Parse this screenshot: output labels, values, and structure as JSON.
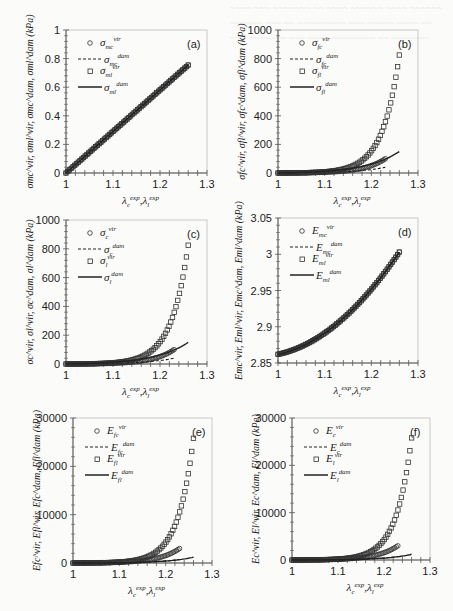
{
  "figure": {
    "background_bleed": "show-through text from reverse page (illegible)",
    "x_tick_labels": [
      "1",
      "1.1",
      "1.2",
      "1.3"
    ]
  },
  "chart_data": [
    {
      "id": "a",
      "panel_label": "(a)",
      "type": "line",
      "box": {
        "x0": 66,
        "x1": 207,
        "y0": 30,
        "y1": 173
      },
      "xlim": [
        1,
        1.3
      ],
      "ylim": [
        0,
        1
      ],
      "yticks": [
        0,
        0.2,
        0.4,
        0.6,
        0.8,
        1
      ],
      "ytick_labels": [
        "0",
        "0.2",
        "0.4",
        "0.6",
        "0.8",
        "1"
      ],
      "xlabel": "λc^exp, λl^exp",
      "ylabel": "σmc^vir, σml^vir, σmc^dam, σml^dam (kPa)",
      "legend": [
        {
          "marker": "circle",
          "base": "σ",
          "sub": "mc",
          "sup": "vir"
        },
        {
          "marker": "dashed",
          "base": "σ",
          "sub": "mc",
          "sup": "dam"
        },
        {
          "marker": "square",
          "base": "σ",
          "sub": "ml",
          "sup": "vir"
        },
        {
          "marker": "solid",
          "base": "σ",
          "sub": "ml",
          "sup": "dam"
        }
      ],
      "series": [
        {
          "name": "σmc vir",
          "style": "circle",
          "x": [
            1.0,
            1.26
          ],
          "y": [
            0,
            0.755
          ],
          "curve": "linear"
        },
        {
          "name": "σmc dam",
          "style": "dashed",
          "x": [
            1.0,
            1.26
          ],
          "y": [
            0,
            0.755
          ],
          "curve": "linear"
        },
        {
          "name": "σml vir",
          "style": "square",
          "x": [
            1.0,
            1.26
          ],
          "y": [
            0,
            0.755
          ],
          "curve": "linear"
        },
        {
          "name": "σml dam",
          "style": "solid",
          "x": [
            1.0,
            1.26
          ],
          "y": [
            0,
            0.755
          ],
          "curve": "linear"
        }
      ]
    },
    {
      "id": "b",
      "panel_label": "(b)",
      "type": "scatter",
      "box": {
        "x0": 278,
        "x1": 418,
        "y0": 30,
        "y1": 173
      },
      "xlim": [
        1,
        1.3
      ],
      "ylim": [
        0,
        1000
      ],
      "yticks": [
        0,
        200,
        400,
        600,
        800,
        1000
      ],
      "ytick_labels": [
        "0",
        "200",
        "400",
        "600",
        "800",
        "1000"
      ],
      "xlabel": "λc^exp, λl^exp",
      "ylabel": "σfc^vir, σfl^vir, σfc^dam, σfl^dam (kPa)",
      "legend": [
        {
          "marker": "circle",
          "base": "σ",
          "sub": "fc",
          "sup": "vir"
        },
        {
          "marker": "dashed",
          "base": "σ",
          "sub": "fc",
          "sup": "dam"
        },
        {
          "marker": "square",
          "base": "σ",
          "sub": "fl",
          "sup": "vir"
        },
        {
          "marker": "solid",
          "base": "σ",
          "sub": "fl",
          "sup": "dam"
        }
      ],
      "series": [
        {
          "name": "σfc vir",
          "style": "circle",
          "xend": 1.23,
          "yend": 100,
          "k": 22
        },
        {
          "name": "σfc dam",
          "style": "dashed",
          "xend": 1.23,
          "yend": 40,
          "k": 16
        },
        {
          "name": "σfl vir",
          "style": "square",
          "xend": 1.26,
          "yend": 825,
          "k": 28
        },
        {
          "name": "σfl dam",
          "style": "solid",
          "xend": 1.26,
          "yend": 150,
          "k": 14
        }
      ]
    },
    {
      "id": "c",
      "panel_label": "(c)",
      "type": "scatter",
      "box": {
        "x0": 66,
        "x1": 207,
        "y0": 220,
        "y1": 364
      },
      "xlim": [
        1,
        1.3
      ],
      "ylim": [
        0,
        1000
      ],
      "yticks": [
        0,
        200,
        400,
        600,
        800,
        1000
      ],
      "ytick_labels": [
        "0",
        "200",
        "400",
        "600",
        "800",
        "1000"
      ],
      "xlabel": "λc^exp, λl^exp",
      "ylabel": "σc^vir, σl^vir, σc^dam, σl^dam (kPa)",
      "legend": [
        {
          "marker": "circle",
          "base": "σ",
          "sub": "c",
          "sup": "vir"
        },
        {
          "marker": "dashed",
          "base": "σ",
          "sub": "c",
          "sup": "dam"
        },
        {
          "marker": "square",
          "base": "σ",
          "sub": "l",
          "sup": "vir"
        },
        {
          "marker": "solid",
          "base": "σ",
          "sub": "l",
          "sup": "dam"
        }
      ],
      "series": [
        {
          "name": "σc vir",
          "style": "circle",
          "xend": 1.23,
          "yend": 100,
          "k": 22
        },
        {
          "name": "σc dam",
          "style": "dashed",
          "xend": 1.23,
          "yend": 40,
          "k": 16
        },
        {
          "name": "σl vir",
          "style": "square",
          "xend": 1.26,
          "yend": 825,
          "k": 28
        },
        {
          "name": "σl dam",
          "style": "solid",
          "xend": 1.26,
          "yend": 150,
          "k": 14
        }
      ]
    },
    {
      "id": "d",
      "panel_label": "(d)",
      "type": "line",
      "box": {
        "x0": 278,
        "x1": 418,
        "y0": 218,
        "y1": 363
      },
      "xlim": [
        1,
        1.3
      ],
      "ylim": [
        2.85,
        3.05
      ],
      "yticks": [
        2.85,
        2.9,
        2.95,
        3.0,
        3.05
      ],
      "ytick_labels": [
        "2.85",
        "2.9",
        "2.95",
        "3",
        "3.05"
      ],
      "xlabel": "λc^exp, λl^exp",
      "ylabel": "Emc^vir, Eml^vir, Emc^dam, Eml^dam (kPa)",
      "legend": [
        {
          "marker": "circle",
          "base": "E",
          "sub": "mc",
          "sup": "vir"
        },
        {
          "marker": "dashed",
          "base": "E",
          "sub": "mc",
          "sup": "dam"
        },
        {
          "marker": "square",
          "base": "E",
          "sub": "ml",
          "sup": "vir"
        },
        {
          "marker": "solid",
          "base": "E",
          "sub": "ml",
          "sup": "dam"
        }
      ],
      "series": [
        {
          "name": "Emc vir",
          "style": "circle",
          "x": [
            1.0,
            1.26
          ],
          "y": [
            2.862,
            3.003
          ],
          "curve": "quad"
        },
        {
          "name": "Emc dam",
          "style": "dashed",
          "x": [
            1.0,
            1.26
          ],
          "y": [
            2.862,
            3.003
          ],
          "curve": "quad"
        },
        {
          "name": "Eml vir",
          "style": "square",
          "x": [
            1.0,
            1.26
          ],
          "y": [
            2.862,
            3.003
          ],
          "curve": "quad"
        },
        {
          "name": "Eml dam",
          "style": "solid",
          "x": [
            1.0,
            1.26
          ],
          "y": [
            2.862,
            3.003
          ],
          "curve": "quad"
        }
      ]
    },
    {
      "id": "e",
      "panel_label": "(e)",
      "type": "scatter",
      "box": {
        "x0": 73,
        "x1": 212,
        "y0": 418,
        "y1": 563
      },
      "xlim": [
        1,
        1.3
      ],
      "ylim": [
        0,
        30000
      ],
      "yticks": [
        0,
        10000,
        20000,
        30000
      ],
      "ytick_labels": [
        "0",
        "10000",
        "20000",
        "30000"
      ],
      "xlabel": "λc^exp, λl^exp",
      "ylabel": "Efc^vir, Efl^vir, Efc^dam, Efl^dam (kPa)",
      "legend": [
        {
          "marker": "circle",
          "base": "E",
          "sub": "fc",
          "sup": "vir"
        },
        {
          "marker": "dashed",
          "base": "E",
          "sub": "fc",
          "sup": "dam"
        },
        {
          "marker": "square",
          "base": "E",
          "sub": "fl",
          "sup": "vir"
        },
        {
          "marker": "solid",
          "base": "E",
          "sub": "fl",
          "sup": "dam"
        }
      ],
      "series": [
        {
          "name": "Efc vir",
          "style": "circle",
          "xend": 1.23,
          "yend": 3000,
          "k": 22
        },
        {
          "name": "Efc dam",
          "style": "dashed",
          "xend": 1.23,
          "yend": 700,
          "k": 16
        },
        {
          "name": "Efl vir",
          "style": "square",
          "xend": 1.26,
          "yend": 25800,
          "k": 30
        },
        {
          "name": "Efl dam",
          "style": "solid",
          "xend": 1.26,
          "yend": 1200,
          "k": 18
        }
      ]
    },
    {
      "id": "f",
      "panel_label": "(f)",
      "type": "scatter",
      "box": {
        "x0": 292,
        "x1": 430,
        "y0": 418,
        "y1": 560
      },
      "xlim": [
        1,
        1.3
      ],
      "ylim": [
        0,
        30000
      ],
      "yticks": [
        0,
        10000,
        20000,
        30000
      ],
      "ytick_labels": [
        "0",
        "10000",
        "20000",
        "30000"
      ],
      "xlabel": "λc^exp, λl^exp",
      "ylabel": "Ec^vir, El^vir, Ec^dam, El^dam (kPa)",
      "legend": [
        {
          "marker": "circle",
          "base": "E",
          "sub": "c",
          "sup": "vir"
        },
        {
          "marker": "dashed",
          "base": "E",
          "sub": "c",
          "sup": "dam"
        },
        {
          "marker": "square",
          "base": "E",
          "sub": "l",
          "sup": "vir"
        },
        {
          "marker": "solid",
          "base": "E",
          "sub": "l",
          "sup": "dam"
        }
      ],
      "series": [
        {
          "name": "Ec vir",
          "style": "circle",
          "xend": 1.23,
          "yend": 3000,
          "k": 22
        },
        {
          "name": "Ec dam",
          "style": "dashed",
          "xend": 1.23,
          "yend": 700,
          "k": 16
        },
        {
          "name": "El vir",
          "style": "square",
          "xend": 1.26,
          "yend": 25800,
          "k": 30
        },
        {
          "name": "El dam",
          "style": "solid",
          "xend": 1.26,
          "yend": 1200,
          "k": 18
        }
      ]
    }
  ]
}
